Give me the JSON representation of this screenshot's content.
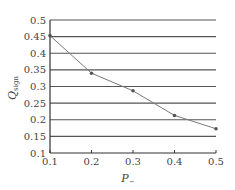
{
  "chart_data": {
    "type": "line",
    "title": "",
    "xlabel": "P_",
    "ylabel": "Q_sign",
    "x": [
      0.1,
      0.2,
      0.3,
      0.4,
      0.5
    ],
    "series": [
      {
        "name": "Q_sign",
        "values": [
          0.453,
          0.34,
          0.287,
          0.213,
          0.173
        ],
        "color": "#7a7a7a"
      }
    ],
    "xlim": [
      0.1,
      0.5
    ],
    "ylim": [
      0.1,
      0.5
    ],
    "xticks": [
      "0.1",
      "0.2",
      "0.3",
      "0.4",
      "0.5"
    ],
    "yticks": [
      "0.1",
      "0.15",
      "0.2",
      "0.25",
      "0.3",
      "0.35",
      "0.4",
      "0.45",
      "0.5"
    ],
    "grid": "horizontal",
    "legend": "none"
  },
  "labels": {
    "x_main": "P",
    "x_sub": "−",
    "y_main": "Q",
    "y_sub": "sign"
  }
}
